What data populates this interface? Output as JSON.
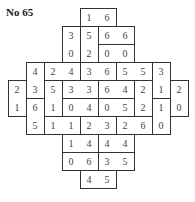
{
  "title": "No 65",
  "cell_size": 18,
  "dominoes": [
    {
      "r": 0,
      "c": 4,
      "dir": "h",
      "a": "1",
      "b": "6"
    },
    {
      "r": 1,
      "c": 3,
      "dir": "v",
      "a": "3",
      "b": "0"
    },
    {
      "r": 1,
      "c": 4,
      "dir": "v",
      "a": "5",
      "b": "2"
    },
    {
      "r": 1,
      "c": 5,
      "dir": "h",
      "a": "6",
      "b": "6"
    },
    {
      "r": 2,
      "c": 5,
      "dir": "h",
      "a": "0",
      "b": "0"
    },
    {
      "r": 3,
      "c": 1,
      "dir": "v",
      "a": "4",
      "b": "3"
    },
    {
      "r": 3,
      "c": 2,
      "dir": "h",
      "a": "2",
      "b": "4"
    },
    {
      "r": 3,
      "c": 4,
      "dir": "h",
      "a": "3",
      "b": "6"
    },
    {
      "r": 3,
      "c": 6,
      "dir": "h",
      "a": "5",
      "b": "5"
    },
    {
      "r": 3,
      "c": 8,
      "dir": "v",
      "a": "3",
      "b": "1"
    },
    {
      "r": 4,
      "c": 0,
      "dir": "v",
      "a": "2",
      "b": "1"
    },
    {
      "r": 4,
      "c": 2,
      "dir": "v",
      "a": "5",
      "b": "1"
    },
    {
      "r": 4,
      "c": 3,
      "dir": "h",
      "a": "3",
      "b": "3"
    },
    {
      "r": 4,
      "c": 5,
      "dir": "h",
      "a": "6",
      "b": "4"
    },
    {
      "r": 4,
      "c": 7,
      "dir": "v",
      "a": "2",
      "b": "2"
    },
    {
      "r": 4,
      "c": 9,
      "dir": "v",
      "a": "2",
      "b": "0"
    },
    {
      "r": 5,
      "c": 1,
      "dir": "v",
      "a": "6",
      "b": "5"
    },
    {
      "r": 5,
      "c": 3,
      "dir": "h",
      "a": "0",
      "b": "4"
    },
    {
      "r": 5,
      "c": 5,
      "dir": "h",
      "a": "0",
      "b": "5"
    },
    {
      "r": 5,
      "c": 8,
      "dir": "v",
      "a": "1",
      "b": "0"
    },
    {
      "r": 6,
      "c": 2,
      "dir": "h",
      "a": "1",
      "b": "1"
    },
    {
      "r": 6,
      "c": 4,
      "dir": "h",
      "a": "2",
      "b": "3"
    },
    {
      "r": 6,
      "c": 6,
      "dir": "h",
      "a": "2",
      "b": "6"
    },
    {
      "r": 7,
      "c": 3,
      "dir": "h",
      "a": "1",
      "b": "4"
    },
    {
      "r": 7,
      "c": 5,
      "dir": "h",
      "a": "4",
      "b": "4"
    },
    {
      "r": 8,
      "c": 3,
      "dir": "h",
      "a": "0",
      "b": "6"
    },
    {
      "r": 8,
      "c": 5,
      "dir": "h",
      "a": "3",
      "b": "5"
    },
    {
      "r": 9,
      "c": 4,
      "dir": "h",
      "a": "4",
      "b": "5"
    }
  ]
}
